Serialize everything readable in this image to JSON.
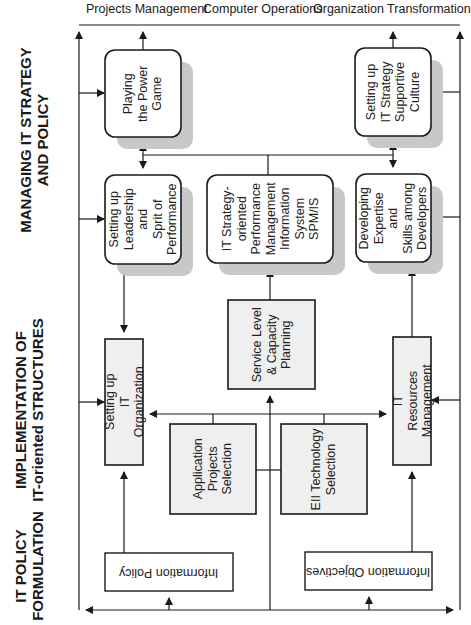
{
  "top_labels": [
    "Projects Management",
    "Computer Operations",
    "Organization Transformation"
  ],
  "side_labels": {
    "managing": "MANAGING IT STRATEGY\nAND POLICY",
    "implementation": "IMPLEMENTATION OF\nIT-oriented STRUCTURES",
    "formulation": "IT POLICY\nFORMULATION"
  },
  "boxes": {
    "power_game": "Playing\nthe Power\nGame",
    "supportive_culture": "Setting up\nIT Strategy\nSupportive\nCulture",
    "leadership": "Setting up\nLeadership and\nSprit of\nPerformance",
    "spm_is": "IT Strategy-\noriented\nPerformance\nManagement\nInformation\nSystem\nSPM/IS",
    "expertise": "Developing\nExpertise and\nSkills among\nDevelopers",
    "service_level": "Service Level\n& Capacity\nPlanning",
    "it_organization": "Setting up\nIT Organization",
    "application_projects": "Application\nProjects\nSelection",
    "eii_technology": "EII Technology\nSelection",
    "it_resources": "IT Resources\nManagement",
    "information_policy": "Information Policy",
    "information_objectives": "Information Objectives"
  },
  "colors": {
    "line": "#1a1a1a",
    "box_fill_light": "#ffffff",
    "box_fill_gray": "#efefef",
    "shadow": "#c8c8c8"
  }
}
